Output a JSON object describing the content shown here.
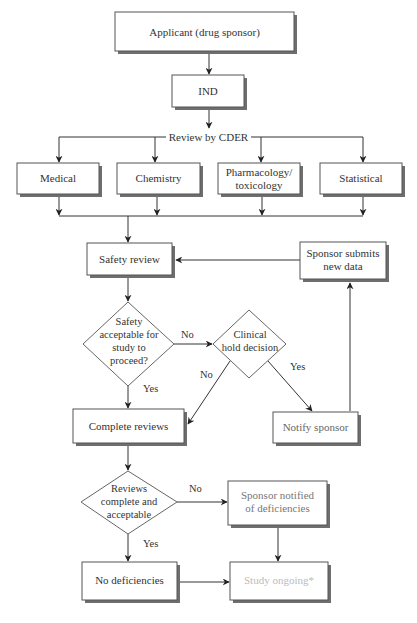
{
  "diagram": {
    "nodes": {
      "applicant": {
        "label": "Applicant (drug sponsor)",
        "text_color": "#333333"
      },
      "ind": {
        "label": "IND",
        "text_color": "#333333"
      },
      "review_header": {
        "label": "Review by CDER"
      },
      "medical": {
        "label": "Medical",
        "text_color": "#333333"
      },
      "chemistry": {
        "label": "Chemistry",
        "text_color": "#333333"
      },
      "pharmacology": {
        "line1": "Pharmacology/",
        "line2": "toxicology",
        "text_color": "#333333"
      },
      "statistical": {
        "label": "Statistical",
        "text_color": "#333333"
      },
      "safety_review": {
        "label": "Safety review",
        "text_color": "#333333"
      },
      "sponsor_submits": {
        "line1": "Sponsor submits",
        "line2": "new data",
        "text_color": "#333333"
      },
      "safety_decision": {
        "line1": "Safety",
        "line2": "acceptable for",
        "line3": "study to",
        "line4": "proceed?"
      },
      "clinical_hold": {
        "line1": "Clinical",
        "line2": "hold decision"
      },
      "complete_reviews": {
        "label": "Complete reviews",
        "text_color": "#333333"
      },
      "notify_sponsor": {
        "label": "Notify sponsor",
        "text_color": "#666666"
      },
      "reviews_decision": {
        "line1": "Reviews",
        "line2": "complete and",
        "line3": "acceptable"
      },
      "sponsor_notified": {
        "line1": "Sponsor notified",
        "line2": "of deficiencies",
        "text_color": "#777777"
      },
      "no_deficiencies": {
        "label": "No deficiencies",
        "text_color": "#333333"
      },
      "study_ongoing": {
        "label": "Study ongoing*",
        "text_color": "#bbbbbb"
      }
    },
    "edge_labels": {
      "safety_no": "No",
      "safety_yes": "Yes",
      "clinical_no": "No",
      "clinical_yes": "Yes",
      "reviews_no": "No",
      "reviews_yes": "Yes"
    },
    "colors": {
      "box_border": "#555555",
      "shadow": "#6e6e6e",
      "line": "#333333"
    }
  }
}
